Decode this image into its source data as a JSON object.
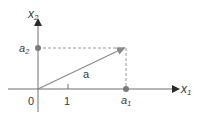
{
  "diagram": {
    "type": "vector-components",
    "axes": {
      "x_label": "x",
      "x_sub": "1",
      "y_label": "x",
      "y_sub": "2"
    },
    "origin_label": "0",
    "tick_label": "1",
    "vector_label": "a",
    "component_x": {
      "label": "a",
      "sub": "1"
    },
    "component_y": {
      "label": "a",
      "sub": "2"
    },
    "colors": {
      "axis": "#6e6e6e",
      "vector": "#8a8a8a",
      "dashed": "#9a9a9a",
      "dot": "#7a7a7a",
      "text": "#3a3a3a"
    }
  }
}
